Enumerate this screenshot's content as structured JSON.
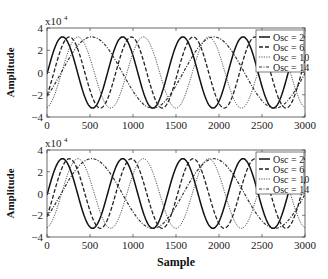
{
  "chart_data": [
    {
      "type": "line",
      "panel": "top",
      "title": "",
      "xlabel": "",
      "ylabel": "Amplitude",
      "y_multiplier": "x10^4",
      "xlim": [
        0,
        3000
      ],
      "ylim": [
        -4,
        4
      ],
      "x_ticks": [
        "0",
        "500",
        "1000",
        "1500",
        "2000",
        "2500",
        "3000"
      ],
      "y_ticks": [
        "-4",
        "-2",
        "0",
        "2",
        "4"
      ],
      "legend_position": "upper right",
      "series": [
        {
          "name": "Osc = 2",
          "style": "solid",
          "amplitude": 3.2,
          "period": 700,
          "phase_peak_at": 180
        },
        {
          "name": "Osc = 6",
          "style": "dashed",
          "amplitude": 3.2,
          "period": 720,
          "phase_peak_at": 260
        },
        {
          "name": "Osc = 10",
          "style": "dotted",
          "amplitude": 3.2,
          "period": 760,
          "phase_peak_at": 360
        },
        {
          "name": "Osc = 14",
          "style": "dash-dot",
          "amplitude": 3.2,
          "period": 1420,
          "phase_peak_at": 520
        }
      ]
    },
    {
      "type": "line",
      "panel": "bottom",
      "title": "",
      "xlabel": "Sample",
      "ylabel": "Amplitude",
      "y_multiplier": "x10^4",
      "xlim": [
        0,
        3000
      ],
      "ylim": [
        -4,
        4
      ],
      "x_ticks": [
        "0",
        "500",
        "1000",
        "1500",
        "2000",
        "2500",
        "3000"
      ],
      "y_ticks": [
        "-4",
        "-2",
        "0",
        "2",
        "4"
      ],
      "legend_position": "upper right",
      "series": [
        {
          "name": "Osc = 2",
          "style": "solid",
          "amplitude": 3.2,
          "period": 700,
          "phase_peak_at": 180
        },
        {
          "name": "Osc = 6",
          "style": "dashed",
          "amplitude": 3.2,
          "period": 720,
          "phase_peak_at": 260
        },
        {
          "name": "Osc = 10",
          "style": "dotted",
          "amplitude": 3.2,
          "period": 760,
          "phase_peak_at": 360
        },
        {
          "name": "Osc = 14",
          "style": "dash-dot",
          "amplitude": 3.2,
          "period": 1420,
          "phase_peak_at": 520
        }
      ]
    }
  ],
  "panels": [
    {
      "ylabel": "Amplitude",
      "multiplier": "x10",
      "exponent": "4"
    },
    {
      "ylabel": "Amplitude",
      "multiplier": "x10",
      "exponent": "4",
      "xlabel": "Sample"
    }
  ],
  "legend": [
    "Osc = 2",
    "Osc = 6",
    "Osc = 10",
    "Osc = 14"
  ]
}
